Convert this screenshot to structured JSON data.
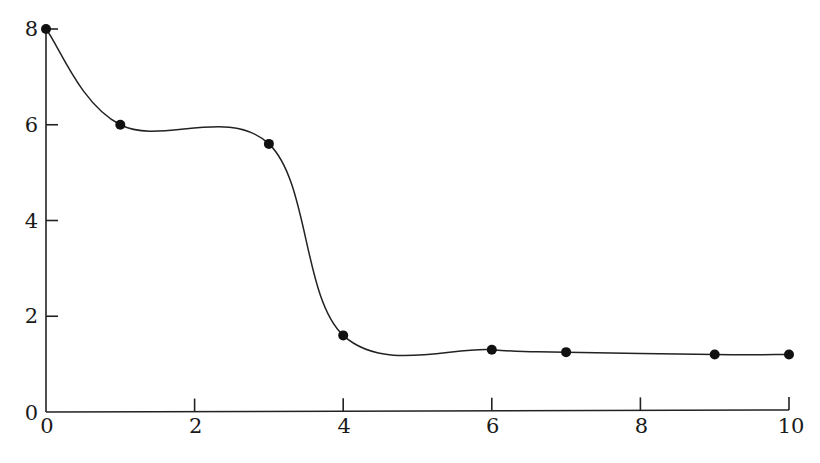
{
  "chart_data": {
    "type": "line",
    "title": "",
    "xlabel": "",
    "ylabel": "",
    "xlim": [
      0,
      10
    ],
    "ylim": [
      0,
      8
    ],
    "grid": false,
    "legend": null,
    "x_ticks": [
      0,
      2,
      4,
      6,
      8,
      10
    ],
    "y_ticks": [
      0,
      2,
      4,
      6,
      8
    ],
    "x_tick_labels": [
      "0",
      "2",
      "4",
      "6",
      "8",
      "10"
    ],
    "y_tick_labels": [
      "0",
      "2",
      "4",
      "6",
      "8"
    ],
    "series": [
      {
        "name": "data",
        "style": "smooth line with filled circle markers",
        "color": "#111111",
        "x": [
          0,
          1,
          3,
          4,
          6,
          7,
          9,
          10
        ],
        "values": [
          8.0,
          6.0,
          5.6,
          1.6,
          1.3,
          1.25,
          1.2,
          1.2
        ]
      }
    ]
  }
}
